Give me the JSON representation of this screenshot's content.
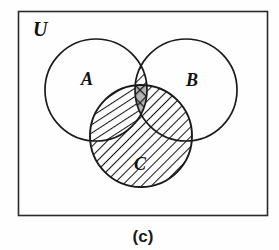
{
  "figure": {
    "caption": "(c)",
    "universe_label": "U",
    "set_labels": {
      "a": "A",
      "b": "B",
      "c": "C"
    },
    "colors": {
      "stroke": "#1a1a1a",
      "background": "#fefefe",
      "hatch": "#1a1a1a",
      "triple_fill": "#b5b5b5"
    },
    "geometry": {
      "frame": {
        "x": 18,
        "y": 11,
        "width": 250,
        "height": 205
      },
      "circle_a": {
        "cx": 96,
        "cy": 90,
        "r": 51
      },
      "circle_b": {
        "cx": 186,
        "cy": 90,
        "r": 51
      },
      "circle_c": {
        "cx": 141,
        "cy": 136,
        "r": 51
      }
    },
    "label_positions": {
      "u": {
        "x": 33,
        "y": 36
      },
      "a": {
        "x": 81,
        "y": 85
      },
      "b": {
        "x": 186,
        "y": 86
      },
      "c": {
        "x": 134,
        "y": 170
      },
      "caption": {
        "x": 143,
        "y": 240
      }
    },
    "shading": {
      "expression": "(A ∩ B) ∪ C",
      "regions": [
        {
          "name": "a-intersect-b-only",
          "pattern": "diagonal-backslash"
        },
        {
          "name": "c-only",
          "pattern": "diagonal-backslash"
        },
        {
          "name": "a-intersect-c-only",
          "pattern": "diagonal-backslash"
        },
        {
          "name": "b-intersect-c-only",
          "pattern": "diagonal-backslash"
        },
        {
          "name": "a-intersect-b-intersect-c",
          "pattern": "cross-hatch-gray"
        },
        {
          "name": "a-only",
          "pattern": "none"
        },
        {
          "name": "b-only",
          "pattern": "none"
        },
        {
          "name": "outside-all",
          "pattern": "none"
        }
      ]
    }
  }
}
